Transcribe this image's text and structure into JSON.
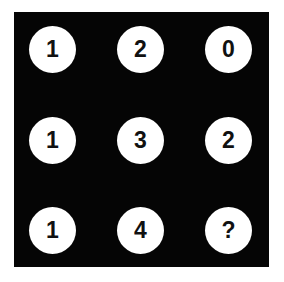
{
  "puzzle": {
    "grid": [
      [
        "1",
        "2",
        "0"
      ],
      [
        "1",
        "3",
        "2"
      ],
      [
        "1",
        "4",
        "?"
      ]
    ],
    "colors": {
      "background": "#050505",
      "circle": "#ffffff",
      "text": "#111111"
    }
  }
}
